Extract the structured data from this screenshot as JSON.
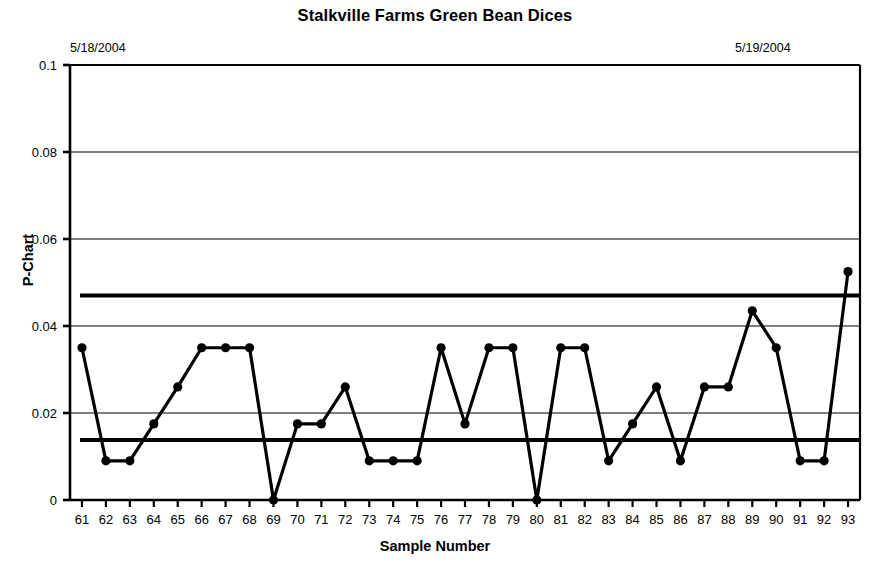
{
  "chart_data": {
    "type": "line",
    "title": "Stalkville Farms Green Bean Dices",
    "xlabel": "Sample Number",
    "ylabel": "P-Chart",
    "xlim": [
      60.5,
      93.5
    ],
    "ylim": [
      0,
      0.1
    ],
    "grid": true,
    "legend_position": "none",
    "x_tick_labels": [
      "61",
      "62",
      "63",
      "64",
      "65",
      "66",
      "67",
      "68",
      "69",
      "70",
      "71",
      "72",
      "73",
      "74",
      "75",
      "76",
      "77",
      "78",
      "79",
      "80",
      "81",
      "82",
      "83",
      "84",
      "85",
      "86",
      "87",
      "88",
      "89",
      "90",
      "91",
      "92",
      "93"
    ],
    "y_tick_labels": [
      "0",
      "0.02",
      "0.04",
      "0.06",
      "0.08",
      "0.1"
    ],
    "y_ticks": [
      0,
      0.02,
      0.04,
      0.06,
      0.08,
      0.1
    ],
    "categories": [
      61,
      62,
      63,
      64,
      65,
      66,
      67,
      68,
      69,
      70,
      71,
      72,
      73,
      74,
      75,
      76,
      77,
      78,
      79,
      80,
      81,
      82,
      83,
      84,
      85,
      86,
      87,
      88,
      89,
      90,
      91,
      92,
      93
    ],
    "series": [
      {
        "name": "Proportion Defective",
        "marker": "filled-circle",
        "values": [
          0.035,
          0.009,
          0.009,
          0.0175,
          0.026,
          0.035,
          0.035,
          0.035,
          0.0,
          0.0175,
          0.0175,
          0.026,
          0.009,
          0.009,
          0.009,
          0.035,
          0.0175,
          0.035,
          0.035,
          0.0,
          0.035,
          0.035,
          0.009,
          0.0175,
          0.026,
          0.009,
          0.026,
          0.026,
          0.0435,
          0.035,
          0.009,
          0.009,
          0.0525
        ]
      }
    ],
    "control_lines": [
      {
        "name": "UCL",
        "value": 0.047
      },
      {
        "name": "CL",
        "value": 0.0138
      }
    ],
    "annotations": [
      {
        "name": "date-left",
        "text": "5/18/2004"
      },
      {
        "name": "date-right",
        "text": "5/19/2004"
      }
    ],
    "colors": {
      "series": "#000000",
      "axis": "#000000",
      "grid": "#000000",
      "background": "#ffffff"
    }
  }
}
